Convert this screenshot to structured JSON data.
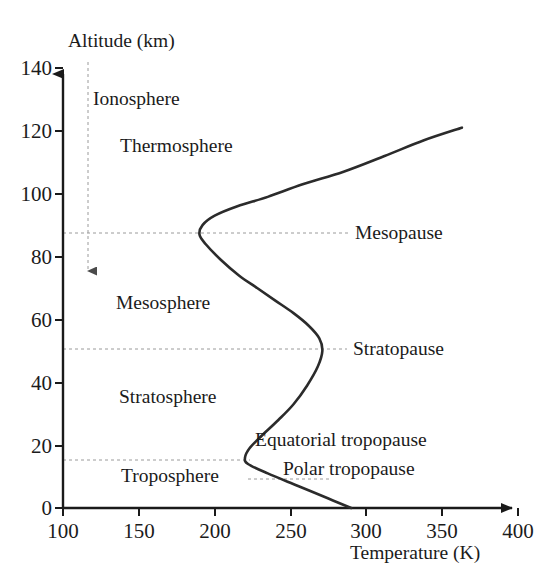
{
  "chart_data": {
    "type": "line",
    "title": "",
    "xlabel": "Temperature (K)",
    "ylabel": "Altitude (km)",
    "xlim": [
      100,
      400
    ],
    "ylim": [
      0,
      140
    ],
    "xticks": [
      100,
      150,
      200,
      250,
      300,
      350,
      400
    ],
    "yticks": [
      0,
      20,
      40,
      60,
      80,
      100,
      120,
      140
    ],
    "grid": false,
    "legend": "none",
    "series": [
      {
        "name": "Standard atmosphere temperature profile",
        "x": [
          290,
          275,
          255,
          235,
          222,
          220,
          223,
          231,
          242,
          252,
          261,
          268,
          271,
          269,
          262,
          252,
          240,
          228,
          216,
          204,
          194,
          190,
          192,
          200,
          215,
          235,
          258,
          285,
          312,
          338,
          363
        ],
        "y": [
          0,
          3,
          7,
          11,
          14,
          16,
          19,
          23,
          28,
          33,
          39,
          45,
          50,
          54,
          58,
          62,
          66,
          70,
          74,
          79,
          84,
          87,
          90,
          93,
          96,
          99,
          103,
          107,
          112,
          117,
          121
        ]
      }
    ],
    "annotations": {
      "layers": [
        {
          "name": "ionosphere",
          "label": "Ionosphere",
          "x": 117,
          "y": 126
        },
        {
          "name": "thermosphere",
          "label": "Thermosphere",
          "x": 152,
          "y": 113
        },
        {
          "name": "mesosphere",
          "label": "Mesosphere",
          "x": 146,
          "y": 61
        },
        {
          "name": "stratosphere",
          "label": "Stratosphere",
          "x": 148,
          "y": 31
        },
        {
          "name": "troposphere",
          "label": "Troposphere",
          "x": 150,
          "y": 6
        }
      ],
      "boundaries": [
        {
          "name": "mesopause",
          "label": "Mesopause",
          "altitude": 87,
          "label_x": 355
        },
        {
          "name": "stratopause",
          "label": "Stratopause",
          "altitude": 50,
          "label_x": 353
        },
        {
          "name": "equatorial-tropopause",
          "label": "Equatorial tropopause",
          "altitude": 16,
          "label_x": 255
        },
        {
          "name": "polar-tropopause",
          "label": "Polar tropopause",
          "altitude": 10,
          "label_x": 283
        }
      ],
      "ionosphere_extent": {
        "from_altitude": 140,
        "to_altitude": 73,
        "temperature": 110
      }
    }
  },
  "axes": {
    "y_title": "Altitude (km)",
    "x_title": "Temperature (K)",
    "y_tick_labels": [
      "140",
      "120",
      "100",
      "80",
      "60",
      "40",
      "20",
      "0"
    ],
    "x_tick_labels": [
      "100",
      "150",
      "200",
      "250",
      "300",
      "350",
      "400"
    ]
  },
  "labels": {
    "ionosphere": "Ionosphere",
    "thermosphere": "Thermosphere",
    "mesosphere": "Mesosphere",
    "stratosphere": "Stratosphere",
    "troposphere": "Troposphere",
    "mesopause": "Mesopause",
    "stratopause": "Stratopause",
    "equatorial_tropopause": "Equatorial tropopause",
    "polar_tropopause": "Polar tropopause"
  },
  "colors": {
    "curve": "#2b2b2b",
    "axis": "#1a1a1a",
    "dashed": "#9a9a9a",
    "text": "#1b1b1b",
    "background": "#ffffff"
  }
}
